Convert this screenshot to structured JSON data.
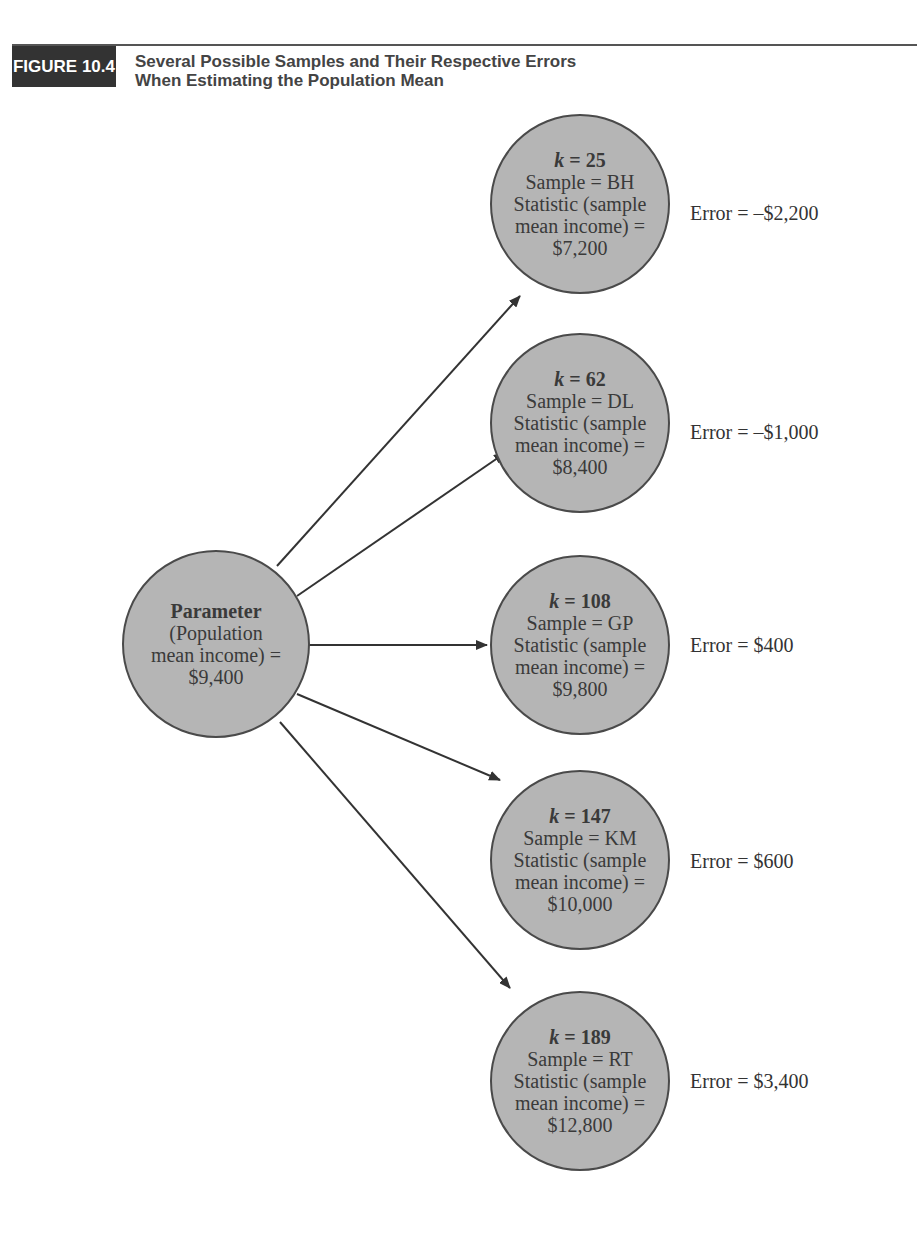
{
  "figure": {
    "label": "FIGURE 10.4",
    "title_line1": "Several Possible Samples and Their Respective Errors",
    "title_line2": "When Estimating the Population Mean"
  },
  "parameter": {
    "title": "Parameter",
    "line2": "(Population",
    "line3": "mean income) =",
    "value": "$9,400"
  },
  "samples": [
    {
      "k_label": "k",
      "k_value": "= 25",
      "sample": "Sample = BH",
      "stat1": "Statistic (sample",
      "stat2": "mean income) =",
      "value": "$7,200",
      "error": "Error = –$2,200"
    },
    {
      "k_label": "k",
      "k_value": "= 62",
      "sample": "Sample = DL",
      "stat1": "Statistic (sample",
      "stat2": "mean income) =",
      "value": "$8,400",
      "error": "Error = –$1,000"
    },
    {
      "k_label": "k",
      "k_value": "= 108",
      "sample": "Sample = GP",
      "stat1": "Statistic (sample",
      "stat2": "mean income) =",
      "value": "$9,800",
      "error": "Error = $400"
    },
    {
      "k_label": "k",
      "k_value": "= 147",
      "sample": "Sample = KM",
      "stat1": "Statistic (sample",
      "stat2": "mean income) =",
      "value": "$10,000",
      "error": "Error = $600"
    },
    {
      "k_label": "k",
      "k_value": "= 189",
      "sample": "Sample = RT",
      "stat1": "Statistic (sample",
      "stat2": "mean income) =",
      "value": "$12,800",
      "error": "Error = $3,400"
    }
  ],
  "colors": {
    "node_fill": "#b5b5b5",
    "node_border": "#4a4a4a",
    "tag_bg": "#333333"
  }
}
